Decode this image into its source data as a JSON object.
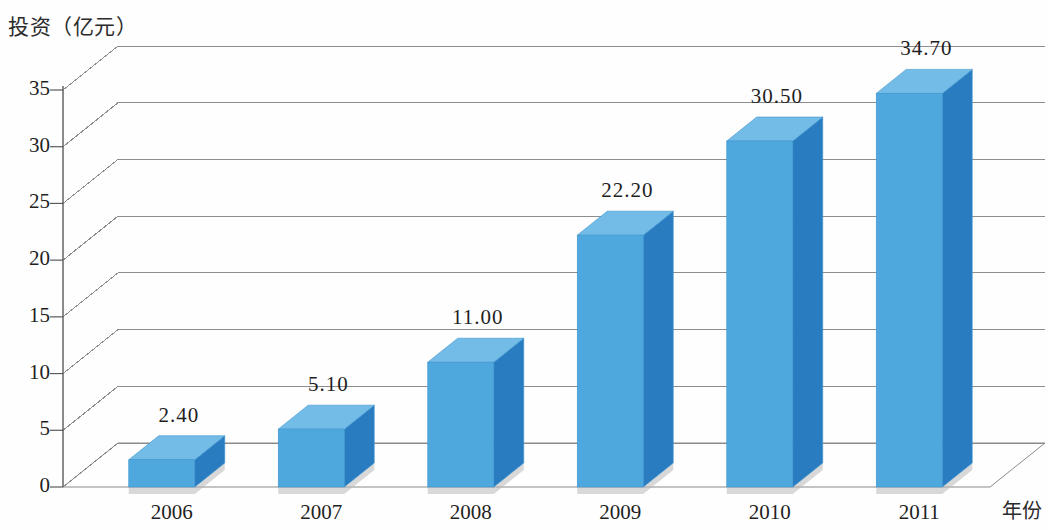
{
  "chart_data": {
    "type": "bar",
    "title": "",
    "ylabel": "投资（亿元）",
    "xlabel": "年份",
    "categories": [
      "2006",
      "2007",
      "2008",
      "2009",
      "2010",
      "2011"
    ],
    "values": [
      2.4,
      5.1,
      11.0,
      22.2,
      30.5,
      34.7
    ],
    "value_labels": [
      "2.40",
      "5.10",
      "11.00",
      "22.20",
      "30.50",
      "34.70"
    ],
    "ytick_labels": [
      "0",
      "5",
      "10",
      "15",
      "20",
      "25",
      "30",
      "35"
    ],
    "yticks": [
      0,
      5,
      10,
      15,
      20,
      25,
      30,
      35
    ],
    "ylim": [
      0,
      35
    ],
    "grid": true,
    "legend": "none",
    "series": [
      {
        "name": "投资（亿元）",
        "values": [
          2.4,
          5.1,
          11.0,
          22.2,
          30.5,
          34.7
        ]
      }
    ],
    "style": {
      "bar_front_color": "#4ea8de",
      "bar_side_color": "#2a7cc0",
      "bar_top_color": "#73bce8",
      "gridline_color": "#8d8d8d",
      "text_color": "#1f1f1f",
      "background_color": "#ffffff",
      "perspective": "3d-column"
    }
  }
}
